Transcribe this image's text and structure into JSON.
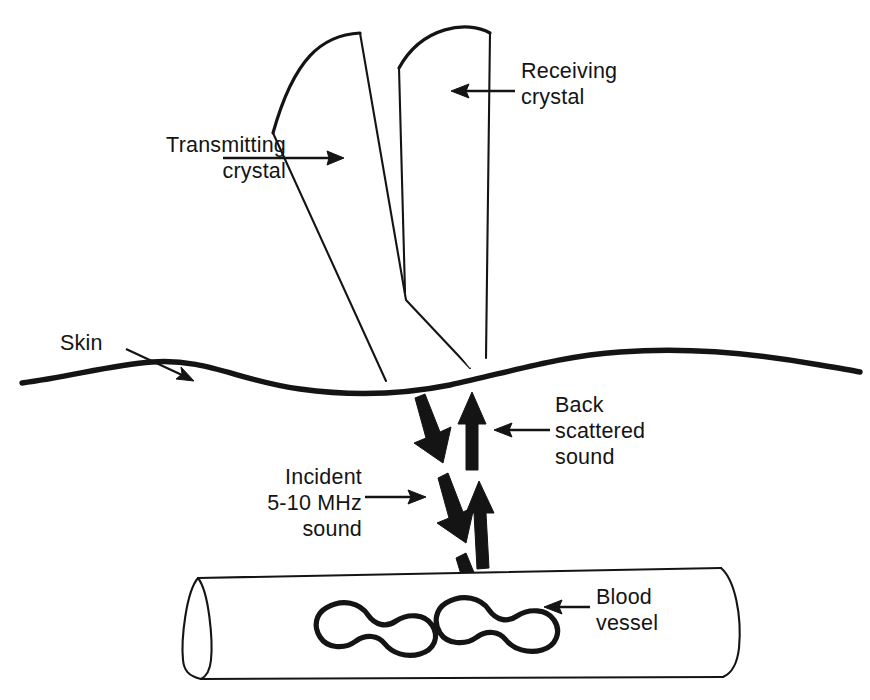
{
  "figure": {
    "background_color": "#ffffff",
    "ink_color": "#141414",
    "width": 870,
    "height": 700
  },
  "labels": {
    "transmitting_crystal": "Transmitting\ncrystal",
    "receiving_crystal": "Receiving\ncrystal",
    "skin": "Skin",
    "back_scattered_sound": "Back\nscattered\nsound",
    "incident_sound": "Incident\n5-10 MHz\nsound",
    "blood_vessel": "Blood\nvessel"
  },
  "annotations": {
    "frequency_range": "5-10 MHz"
  },
  "parts": {
    "transmitting_crystal": "transmitting-crystal-probe",
    "receiving_crystal": "receiving-crystal-probe",
    "skin_surface": "skin-surface-line",
    "blood_vessel": "blood-vessel-cylinder",
    "blood_cells": [
      "blood-cell-left",
      "blood-cell-right"
    ],
    "incident_beam_arrows": 3,
    "backscatter_beam_arrows": 2
  },
  "leaders": {
    "transmitting": "arrow points right to transmitting crystal",
    "receiving": "arrow points left to receiving crystal",
    "skin": "arrow points down-right to skin line",
    "backscatter": "arrow points left to up-going arrow",
    "incident": "arrow points right to down-going arrow",
    "blood_vessel": "arrow points left to blood cell"
  }
}
